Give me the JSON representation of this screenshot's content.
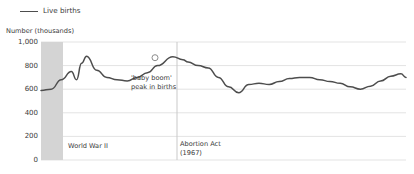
{
  "legend": {
    "label": "Live births",
    "line_color": "#4d4d4d",
    "position": "top-left"
  },
  "axis": {
    "y_title": "Number (thousands)",
    "y_ticks": [
      "1,000",
      "800",
      "600",
      "400",
      "200",
      "0"
    ]
  },
  "annotations": {
    "baby_boom": "'baby boom'\npeak in births",
    "world_war_2": "World War II",
    "abortion_act": "Abortion Act\n(1967)"
  },
  "chart_data": {
    "type": "line",
    "title": "",
    "subtitle": "",
    "xlabel": "",
    "ylabel": "Number (thousands)",
    "ylim": [
      0,
      1000
    ],
    "xlim": [
      1938,
      2010
    ],
    "yticks": [
      0,
      200,
      400,
      600,
      800,
      1000
    ],
    "grid": "horizontal",
    "legend_position": "top-left",
    "series": [
      {
        "name": "Live births",
        "color": "#4d4d4d",
        "units": "thousands",
        "x": [
          1938,
          1940,
          1942,
          1944,
          1945,
          1946,
          1947,
          1949,
          1951,
          1953,
          1955,
          1957,
          1959,
          1961,
          1964,
          1966,
          1967,
          1969,
          1971,
          1973,
          1975,
          1977,
          1979,
          1981,
          1983,
          1985,
          1987,
          1989,
          1991,
          1993,
          1995,
          1997,
          1999,
          2001,
          2003,
          2005,
          2007,
          2009,
          2010
        ],
        "values": [
          590,
          600,
          680,
          750,
          680,
          820,
          880,
          760,
          700,
          680,
          670,
          700,
          740,
          800,
          875,
          850,
          830,
          800,
          780,
          700,
          620,
          570,
          640,
          650,
          640,
          665,
          690,
          700,
          700,
          680,
          665,
          650,
          620,
          600,
          625,
          670,
          710,
          730,
          700
        ]
      }
    ],
    "annotations": [
      {
        "name": "baby-boom-peak",
        "label": "'baby boom'\npeak in births",
        "x": 1964,
        "y": 875,
        "marker": "circle"
      },
      {
        "name": "world-war-2-band",
        "label": "World War II",
        "type": "vertical-band",
        "x_start": 1939,
        "x_end": 1945,
        "fill": "#d4d4d4"
      },
      {
        "name": "abortion-act-marker",
        "label": "Abortion Act\n(1967)",
        "type": "vertical-line",
        "x": 1967,
        "stroke": "#c9c9c9"
      }
    ]
  },
  "geometry": {
    "plot_left": 41,
    "plot_right": 406,
    "plot_top": 42,
    "plot_bottom": 160,
    "band_left": 41,
    "band_right": 63,
    "vline_x": 177,
    "marker_x": 155,
    "marker_y": 57.7
  }
}
